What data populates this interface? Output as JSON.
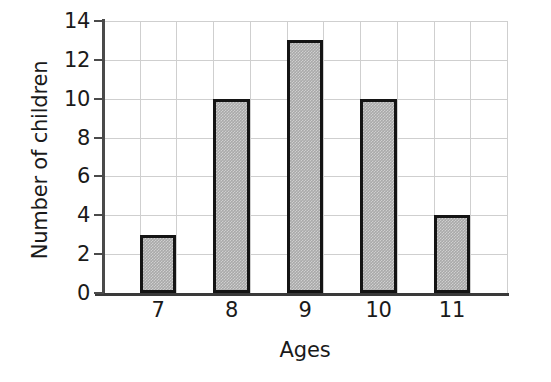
{
  "chart_data": {
    "type": "bar",
    "title": "",
    "subtitle": "",
    "xlabel": "Ages",
    "ylabel": "Number of children",
    "categories": [
      "7",
      "8",
      "9",
      "10",
      "11"
    ],
    "values": [
      3,
      10,
      13,
      10,
      4
    ],
    "series": [
      {
        "name": "Number of children",
        "values": [
          3,
          10,
          13,
          10,
          4
        ]
      }
    ],
    "ylim": [
      0,
      14
    ],
    "ytick_labels": [
      "0",
      "2",
      "4",
      "6",
      "8",
      "10",
      "12",
      "14"
    ],
    "ytick_values": [
      0,
      2,
      4,
      6,
      8,
      10,
      12,
      14
    ],
    "xtick_labels": [
      "7",
      "8",
      "9",
      "10",
      "11"
    ],
    "grid": true,
    "grid_color": "#cfcfcf",
    "legend": "none",
    "bar_fill_color": "#a9a9a9",
    "bar_edge_color": "#141414",
    "axis_color": "#3a3a3a",
    "background_color": "#ffffff",
    "annotations": []
  }
}
